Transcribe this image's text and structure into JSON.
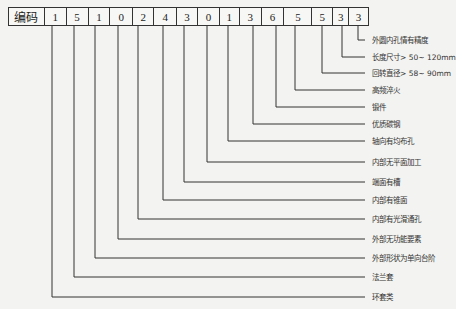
{
  "diagram": {
    "header_label": "编码",
    "digits": [
      "1",
      "5",
      "1",
      "0",
      "2",
      "4",
      "3",
      "0",
      "1",
      "3",
      "6",
      "5",
      "5",
      "3",
      "3"
    ],
    "labels": [
      "外圆内孔情有精度",
      "长度尺寸> 50~ 120mm",
      "回转直径> 58~ 90mm",
      "高频淬火",
      "锻件",
      "优质碳钢",
      "轴向有均布孔",
      "内部无平面加工",
      "端面有槽",
      "内部有锥面",
      "内部有光滑通孔",
      "外部无功能要素",
      "外部形状为单向台阶",
      "法兰套",
      "环套类"
    ],
    "colors": {
      "line": "#333333",
      "background": "#f3f3f1"
    }
  }
}
